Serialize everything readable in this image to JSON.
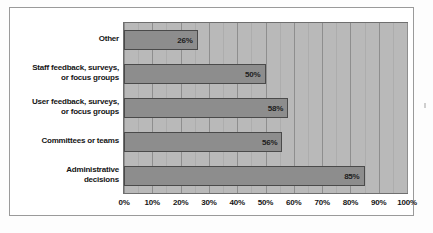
{
  "chart_data": {
    "type": "bar",
    "orientation": "horizontal",
    "title": "",
    "xlabel": "",
    "ylabel": "",
    "categories": [
      "Other",
      "Staff feedback, surveys, or focus groups",
      "User feedback, surveys, or focus groups",
      "Committees or teams",
      "Administrative decisions"
    ],
    "category_lines": [
      [
        "Other"
      ],
      [
        "Staff feedback, surveys,",
        "or focus groups"
      ],
      [
        "User feedback, surveys,",
        "or focus groups"
      ],
      [
        "Committees or teams"
      ],
      [
        "Administrative",
        "decisions"
      ]
    ],
    "values": [
      26,
      50,
      58,
      56,
      85
    ],
    "value_labels": [
      "26%",
      "50%",
      "58%",
      "56%",
      "85%"
    ],
    "xlim": [
      0,
      100
    ],
    "xticks": [
      0,
      10,
      20,
      30,
      40,
      50,
      60,
      70,
      80,
      90,
      100
    ],
    "xtick_labels": [
      "0%",
      "10%",
      "20%",
      "30%",
      "40%",
      "50%",
      "60%",
      "70%",
      "80%",
      "90%",
      "100%"
    ],
    "minor_tick_step": 5,
    "grid": true,
    "legend": false,
    "colors": {
      "bar_fill": "#8d8d8d",
      "bar_border": "#4a4a4a",
      "plot_background": "#b9b9b9",
      "major_gridline": "#8e8e8e",
      "minor_gridline": "#adadad",
      "text": "#151515",
      "page_background": "#ffffff",
      "frame_border": "#9a9a9a"
    }
  }
}
